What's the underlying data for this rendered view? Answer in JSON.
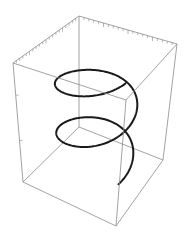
{
  "chart_data": {
    "type": "line",
    "subtype": "3d-parametric-curve",
    "title": "",
    "parametric": {
      "x": "cos(t)",
      "y": "sin(t)",
      "z": "t",
      "t_range": [
        0,
        12.566
      ]
    },
    "xlabel": "",
    "ylabel": "",
    "zlabel": "",
    "xlim": [
      -1,
      1
    ],
    "ylim": [
      -1,
      1
    ],
    "zlim": [
      0,
      12.566
    ],
    "turns": 2,
    "box": true,
    "tick_labels": [],
    "grid": false,
    "legend": "none",
    "colors": {
      "curve": "#1a1a1a",
      "box": "#8a8a8a",
      "background": "#ffffff"
    }
  }
}
